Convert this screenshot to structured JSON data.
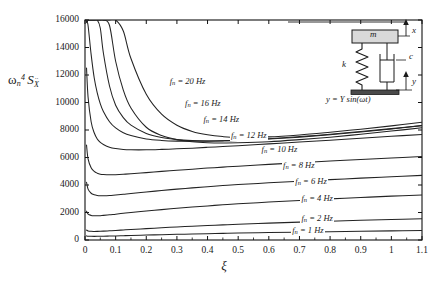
{
  "figure": {
    "ylabel_parts": {
      "omega": "ω",
      "omega_sub": "n",
      "omega_sup": "4",
      "s": "S",
      "s_sub": "X"
    },
    "xlabel": "ξ"
  },
  "inset": {
    "mass_label": "m",
    "spring_label": "k",
    "damper_label": "c",
    "x_label": "x",
    "y_label": "y",
    "equation": "y = Y sin(ωt)"
  },
  "chart_data": {
    "type": "line",
    "title": "",
    "xlabel": "ξ",
    "ylabel": "ωn^4 S_Ẍ",
    "xlim": [
      0,
      1.1
    ],
    "ylim": [
      0,
      16000
    ],
    "xticks": [
      0,
      0.1,
      0.2,
      0.3,
      0.4,
      0.5,
      0.6,
      0.7,
      0.8,
      0.9,
      1,
      1.1
    ],
    "xticklabels": [
      "0",
      "0.1",
      "0.2",
      "0.3",
      "0.4",
      "0.5",
      "0.6",
      "0.7",
      "0.8",
      "0.9",
      "1",
      "1.1"
    ],
    "yticks": [
      0,
      2000,
      4000,
      6000,
      8000,
      10000,
      12000,
      14000,
      16000
    ],
    "yticklabels": [
      "0",
      "2000",
      "4000",
      "6000",
      "8000",
      "10000",
      "12000",
      "14000",
      "16000"
    ],
    "grid": false,
    "legend": "inline-curve-labels",
    "series": [
      {
        "name": "f_n = 20 Hz",
        "label": "f",
        "label_sub": "n",
        "label_rest": "= 20 Hz",
        "fn_hz": 20,
        "label_x": 0.345,
        "label_y": 11500,
        "x": [
          0.005,
          0.01,
          0.02,
          0.03,
          0.04,
          0.05,
          0.06,
          0.08,
          0.1,
          0.125,
          0.15,
          0.2,
          0.25,
          0.3,
          0.35,
          0.4,
          0.45,
          0.5,
          0.6,
          0.7,
          0.8,
          0.9,
          1.0,
          1.1
        ],
        "y": [
          16000,
          16000,
          16000,
          16000,
          16000,
          16000,
          16000,
          16000,
          16000,
          15200,
          13200,
          10600,
          9150,
          8350,
          7900,
          7650,
          7520,
          7470,
          7500,
          7640,
          7840,
          8060,
          8300,
          8560
        ]
      },
      {
        "name": "f_n = 16 Hz",
        "label": "f",
        "label_sub": "n",
        "label_rest": "= 16 Hz",
        "fn_hz": 16,
        "label_x": 0.395,
        "label_y": 9900,
        "x": [
          0.005,
          0.01,
          0.02,
          0.03,
          0.04,
          0.05,
          0.06,
          0.08,
          0.1,
          0.125,
          0.15,
          0.2,
          0.25,
          0.3,
          0.35,
          0.4,
          0.45,
          0.5,
          0.6,
          0.7,
          0.8,
          0.9,
          1.0,
          1.1
        ],
        "y": [
          16000,
          16000,
          16000,
          16000,
          16000,
          16000,
          16000,
          15600,
          13000,
          10900,
          9600,
          8200,
          7600,
          7300,
          7150,
          7080,
          7060,
          7070,
          7150,
          7300,
          7480,
          7690,
          7920,
          8160
        ]
      },
      {
        "name": "f_n = 14 Hz",
        "label": "f",
        "label_sub": "n",
        "label_rest": "= 14 Hz",
        "fn_hz": 14,
        "label_x": 0.455,
        "label_y": 8700,
        "x": [
          0.005,
          0.01,
          0.02,
          0.03,
          0.04,
          0.05,
          0.06,
          0.08,
          0.1,
          0.125,
          0.15,
          0.2,
          0.25,
          0.3,
          0.35,
          0.4,
          0.45,
          0.5,
          0.6,
          0.7,
          0.8,
          0.9,
          1.0,
          1.1
        ],
        "y": [
          16000,
          16000,
          16000,
          16000,
          16000,
          15400,
          13600,
          11200,
          9800,
          8900,
          8350,
          7750,
          7450,
          7300,
          7230,
          7200,
          7210,
          7240,
          7340,
          7480,
          7660,
          7860,
          8080,
          8320
        ]
      },
      {
        "name": "f_n = 12 Hz",
        "label": "f",
        "label_sub": "n",
        "label_rest": "= 12 Hz",
        "fn_hz": 12,
        "label_x": 0.545,
        "label_y": 7550,
        "x": [
          0.005,
          0.01,
          0.02,
          0.03,
          0.04,
          0.05,
          0.06,
          0.08,
          0.1,
          0.125,
          0.15,
          0.2,
          0.25,
          0.3,
          0.35,
          0.4,
          0.45,
          0.5,
          0.6,
          0.7,
          0.8,
          0.9,
          1.0,
          1.1
        ],
        "y": [
          16000,
          15600,
          13500,
          11800,
          10700,
          9900,
          9350,
          8600,
          8150,
          7800,
          7600,
          7350,
          7240,
          7190,
          7180,
          7190,
          7220,
          7260,
          7370,
          7520,
          7690,
          7890,
          8100,
          8330
        ]
      },
      {
        "name": "f_n = 10 Hz",
        "label": "f",
        "label_sub": "n",
        "label_rest": "= 10 Hz",
        "fn_hz": 10,
        "label_x": 0.645,
        "label_y": 6550,
        "x": [
          0.005,
          0.01,
          0.02,
          0.03,
          0.04,
          0.05,
          0.06,
          0.08,
          0.1,
          0.125,
          0.15,
          0.2,
          0.25,
          0.3,
          0.35,
          0.4,
          0.45,
          0.5,
          0.6,
          0.7,
          0.8,
          0.9,
          1.0,
          1.1
        ],
        "y": [
          12500,
          10400,
          8600,
          7800,
          7350,
          7100,
          6950,
          6750,
          6650,
          6580,
          6560,
          6560,
          6590,
          6630,
          6680,
          6740,
          6800,
          6860,
          6990,
          7120,
          7260,
          7400,
          7540,
          7680
        ]
      },
      {
        "name": "f_n = 8 Hz",
        "label": "f",
        "label_sub": "n",
        "label_rest": "= 8 Hz",
        "fn_hz": 8,
        "label_x": 0.715,
        "label_y": 5400,
        "x": [
          0.005,
          0.01,
          0.02,
          0.03,
          0.04,
          0.05,
          0.06,
          0.08,
          0.1,
          0.125,
          0.15,
          0.2,
          0.25,
          0.3,
          0.35,
          0.4,
          0.45,
          0.5,
          0.6,
          0.7,
          0.8,
          0.9,
          1.0,
          1.1
        ],
        "y": [
          6900,
          5900,
          5250,
          4990,
          4860,
          4790,
          4760,
          4740,
          4750,
          4780,
          4820,
          4900,
          4990,
          5070,
          5150,
          5230,
          5300,
          5370,
          5500,
          5620,
          5740,
          5850,
          5960,
          6070
        ]
      },
      {
        "name": "f_n = 6 Hz",
        "label": "f",
        "label_sub": "n",
        "label_rest": "= 6 Hz",
        "fn_hz": 6,
        "label_x": 0.755,
        "label_y": 4200,
        "x": [
          0.005,
          0.01,
          0.02,
          0.03,
          0.04,
          0.05,
          0.06,
          0.08,
          0.1,
          0.125,
          0.15,
          0.2,
          0.25,
          0.3,
          0.35,
          0.4,
          0.45,
          0.5,
          0.6,
          0.7,
          0.8,
          0.9,
          1.0,
          1.1
        ],
        "y": [
          4200,
          3700,
          3400,
          3290,
          3240,
          3220,
          3215,
          3230,
          3270,
          3320,
          3380,
          3490,
          3600,
          3700,
          3790,
          3880,
          3960,
          4030,
          4160,
          4280,
          4390,
          4500,
          4600,
          4700
        ]
      },
      {
        "name": "f_n = 4 Hz",
        "label": "f",
        "label_sub": "n",
        "label_rest": "= 4 Hz",
        "fn_hz": 4,
        "label_x": 0.775,
        "label_y": 2950,
        "x": [
          0.005,
          0.01,
          0.02,
          0.03,
          0.04,
          0.05,
          0.06,
          0.08,
          0.1,
          0.125,
          0.15,
          0.2,
          0.25,
          0.3,
          0.35,
          0.4,
          0.45,
          0.5,
          0.6,
          0.7,
          0.8,
          0.9,
          1.0,
          1.1
        ],
        "y": [
          2100,
          1890,
          1790,
          1760,
          1760,
          1770,
          1790,
          1830,
          1880,
          1940,
          2000,
          2110,
          2210,
          2310,
          2400,
          2480,
          2560,
          2630,
          2760,
          2880,
          2990,
          3090,
          3190,
          3280
        ]
      },
      {
        "name": "f_n = 2 Hz",
        "label": "f",
        "label_sub": "n",
        "label_rest": "= 2 Hz",
        "fn_hz": 2,
        "label_x": 0.775,
        "label_y": 1500,
        "x": [
          0.005,
          0.01,
          0.02,
          0.03,
          0.04,
          0.05,
          0.06,
          0.08,
          0.1,
          0.125,
          0.15,
          0.2,
          0.25,
          0.3,
          0.35,
          0.4,
          0.45,
          0.5,
          0.6,
          0.7,
          0.8,
          0.9,
          1.0,
          1.1
        ],
        "y": [
          720,
          660,
          630,
          625,
          628,
          635,
          645,
          668,
          694,
          728,
          762,
          828,
          890,
          948,
          1002,
          1052,
          1100,
          1144,
          1226,
          1300,
          1368,
          1432,
          1492,
          1548
        ]
      },
      {
        "name": "f_n = 1 Hz",
        "label": "f",
        "label_sub": "n",
        "label_rest": "= 1 Hz",
        "fn_hz": 1,
        "label_x": 0.745,
        "label_y": 620,
        "x": [
          0.005,
          0.01,
          0.02,
          0.03,
          0.04,
          0.05,
          0.06,
          0.08,
          0.1,
          0.125,
          0.15,
          0.2,
          0.25,
          0.3,
          0.35,
          0.4,
          0.45,
          0.5,
          0.6,
          0.7,
          0.8,
          0.9,
          1.0,
          1.1
        ],
        "y": [
          300,
          278,
          266,
          264,
          266,
          270,
          275,
          286,
          298,
          313,
          328,
          358,
          386,
          412,
          437,
          460,
          482,
          502,
          540,
          574,
          606,
          636,
          664,
          690
        ]
      }
    ]
  },
  "colors": {
    "ink": "#1a1a1a",
    "curve": "#232323",
    "frame": "#111111",
    "mass_fill": "#d9d9d9",
    "base_fill": "#4a4a4a"
  }
}
